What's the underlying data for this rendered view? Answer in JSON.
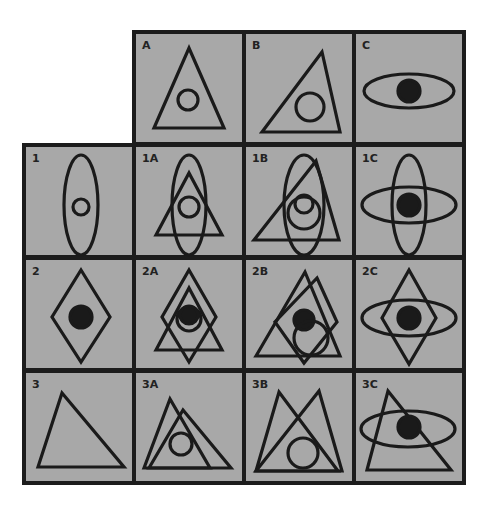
{
  "figure": {
    "width": 491,
    "height": 511,
    "colors": {
      "background": "#ffffff",
      "cell_fill": "#a8a8a8",
      "border": "#1c1c1c",
      "stroke": "#1a1a1a"
    },
    "stroke_width": 3.2,
    "cell_inner": {
      "w": 106,
      "h": 108
    }
  },
  "columns": [
    {
      "key": "row-label",
      "x": 26
    },
    {
      "key": "A",
      "x": 136
    },
    {
      "key": "B",
      "x": 246
    },
    {
      "key": "C",
      "x": 356
    }
  ],
  "rows": [
    {
      "key": "header",
      "y": 34
    },
    {
      "key": "1",
      "y": 147
    },
    {
      "key": "2",
      "y": 260
    },
    {
      "key": "3",
      "y": 373
    }
  ],
  "cells": [
    {
      "label": "A",
      "col": 1,
      "row": 0,
      "shapes": [
        {
          "type": "polygon",
          "points": [
            [
              18,
              94
            ],
            [
              53,
              14
            ],
            [
              88,
              94
            ]
          ]
        },
        {
          "type": "circle",
          "cx": 52,
          "cy": 66,
          "r": 10
        }
      ]
    },
    {
      "label": "B",
      "col": 2,
      "row": 0,
      "shapes": [
        {
          "type": "polygon",
          "points": [
            [
              16,
              98
            ],
            [
              76,
              18
            ],
            [
              94,
              98
            ]
          ]
        },
        {
          "type": "circle",
          "cx": 64,
          "cy": 73,
          "r": 14
        }
      ]
    },
    {
      "label": "C",
      "col": 3,
      "row": 0,
      "shapes": [
        {
          "type": "ellipse",
          "cx": 53,
          "cy": 57,
          "rx": 45,
          "ry": 17
        },
        {
          "type": "circle",
          "cx": 53,
          "cy": 57,
          "r": 11,
          "filled": true
        }
      ]
    },
    {
      "label": "1",
      "col": 0,
      "row": 1,
      "shapes": [
        {
          "type": "ellipse",
          "cx": 55,
          "cy": 58,
          "rx": 17,
          "ry": 50
        },
        {
          "type": "circle",
          "cx": 55,
          "cy": 60,
          "r": 8
        }
      ]
    },
    {
      "label": "1A",
      "col": 1,
      "row": 1,
      "shapes": [
        {
          "type": "ellipse",
          "cx": 53,
          "cy": 58,
          "rx": 17,
          "ry": 50
        },
        {
          "type": "polygon",
          "points": [
            [
              20,
              88
            ],
            [
              53,
              26
            ],
            [
              86,
              88
            ]
          ]
        },
        {
          "type": "circle",
          "cx": 53,
          "cy": 60,
          "r": 10
        }
      ]
    },
    {
      "label": "1B",
      "col": 2,
      "row": 1,
      "shapes": [
        {
          "type": "ellipse",
          "cx": 58,
          "cy": 58,
          "rx": 20,
          "ry": 50
        },
        {
          "type": "polygon",
          "points": [
            [
              8,
              93
            ],
            [
              70,
              14
            ],
            [
              93,
              93
            ]
          ]
        },
        {
          "type": "circle",
          "cx": 58,
          "cy": 66,
          "r": 16
        },
        {
          "type": "circle",
          "cx": 58,
          "cy": 57,
          "r": 9
        }
      ]
    },
    {
      "label": "1C",
      "col": 3,
      "row": 1,
      "shapes": [
        {
          "type": "ellipse",
          "cx": 53,
          "cy": 58,
          "rx": 17,
          "ry": 50
        },
        {
          "type": "ellipse",
          "cx": 53,
          "cy": 58,
          "rx": 47,
          "ry": 18
        },
        {
          "type": "circle",
          "cx": 53,
          "cy": 58,
          "r": 11,
          "filled": true
        }
      ]
    },
    {
      "label": "2",
      "col": 0,
      "row": 2,
      "shapes": [
        {
          "type": "polygon",
          "points": [
            [
              55,
              10
            ],
            [
              84,
              57
            ],
            [
              55,
              102
            ],
            [
              26,
              57
            ]
          ]
        },
        {
          "type": "circle",
          "cx": 55,
          "cy": 57,
          "r": 11,
          "filled": true
        }
      ]
    },
    {
      "label": "2A",
      "col": 1,
      "row": 2,
      "shapes": [
        {
          "type": "polygon",
          "points": [
            [
              53,
              10
            ],
            [
              80,
              57
            ],
            [
              53,
              102
            ],
            [
              26,
              57
            ]
          ]
        },
        {
          "type": "polygon",
          "points": [
            [
              20,
              90
            ],
            [
              53,
              28
            ],
            [
              86,
              90
            ]
          ]
        },
        {
          "type": "circle",
          "cx": 53,
          "cy": 59,
          "r": 12
        },
        {
          "type": "circle",
          "cx": 53,
          "cy": 55,
          "r": 9,
          "filled": true
        }
      ]
    },
    {
      "label": "2B",
      "col": 2,
      "row": 2,
      "shapes": [
        {
          "type": "polygon",
          "points": [
            [
              10,
              96
            ],
            [
              59,
              12
            ],
            [
              94,
              96
            ]
          ]
        },
        {
          "type": "polygon",
          "points": [
            [
              71,
              18
            ],
            [
              91,
              62
            ],
            [
              58,
              103
            ],
            [
              29,
              62
            ]
          ]
        },
        {
          "type": "circle",
          "cx": 58,
          "cy": 60,
          "r": 10,
          "filled": true
        },
        {
          "type": "circle",
          "cx": 65,
          "cy": 78,
          "r": 17
        }
      ]
    },
    {
      "label": "2C",
      "col": 3,
      "row": 2,
      "shapes": [
        {
          "type": "polygon",
          "points": [
            [
              53,
              10
            ],
            [
              80,
              58
            ],
            [
              53,
              104
            ],
            [
              26,
              58
            ]
          ]
        },
        {
          "type": "ellipse",
          "cx": 53,
          "cy": 58,
          "rx": 47,
          "ry": 18
        },
        {
          "type": "circle",
          "cx": 53,
          "cy": 58,
          "r": 11,
          "filled": true
        }
      ]
    },
    {
      "label": "3",
      "col": 0,
      "row": 3,
      "shapes": [
        {
          "type": "polygon",
          "points": [
            [
              12,
              94
            ],
            [
              36,
              20
            ],
            [
              98,
              94
            ]
          ]
        }
      ]
    },
    {
      "label": "3A",
      "col": 1,
      "row": 3,
      "shapes": [
        {
          "type": "polygon",
          "points": [
            [
              8,
              95
            ],
            [
              34,
              26
            ],
            [
              74,
              95
            ]
          ]
        },
        {
          "type": "polygon",
          "points": [
            [
              13,
              95
            ],
            [
              47,
              37
            ],
            [
              95,
              95
            ]
          ]
        },
        {
          "type": "circle",
          "cx": 45,
          "cy": 71,
          "r": 11
        }
      ]
    },
    {
      "label": "3B",
      "col": 2,
      "row": 3,
      "shapes": [
        {
          "type": "polygon",
          "points": [
            [
              10,
              98
            ],
            [
              33,
              19
            ],
            [
              92,
              98
            ]
          ]
        },
        {
          "type": "polygon",
          "points": [
            [
              10,
              98
            ],
            [
              73,
              18
            ],
            [
              96,
              98
            ]
          ]
        },
        {
          "type": "circle",
          "cx": 57,
          "cy": 80,
          "r": 15
        }
      ]
    },
    {
      "label": "3C",
      "col": 3,
      "row": 3,
      "shapes": [
        {
          "type": "polygon",
          "points": [
            [
              11,
              97
            ],
            [
              32,
              18
            ],
            [
              95,
              97
            ]
          ]
        },
        {
          "type": "ellipse",
          "cx": 52,
          "cy": 56,
          "rx": 47,
          "ry": 18
        },
        {
          "type": "circle",
          "cx": 53,
          "cy": 54,
          "r": 11,
          "filled": true
        }
      ]
    }
  ]
}
